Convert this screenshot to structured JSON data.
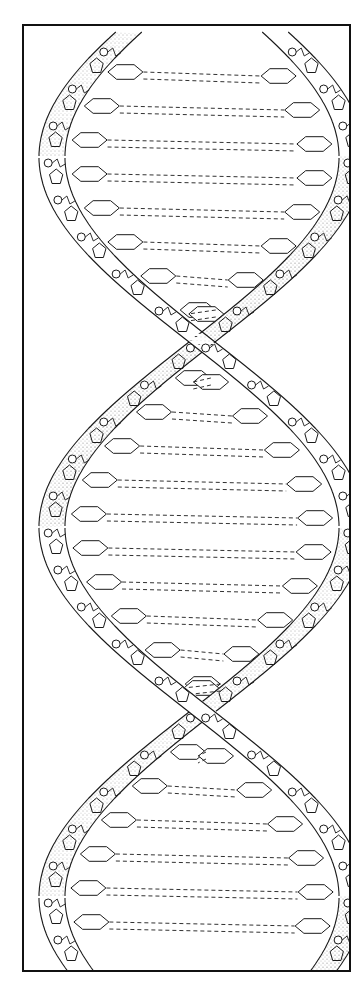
{
  "figure": {
    "frame": {
      "x": 22,
      "y": 24,
      "width": 329,
      "height": 948,
      "stroke": "#111111"
    },
    "colors": {
      "ink": "#1a1a1a",
      "paper": "#ffffff",
      "stipple": "#555555"
    },
    "helix": {
      "center_x": 200,
      "amplitude": 150,
      "period": 740,
      "phase_y": -30,
      "strand_width": 26,
      "top_y": 30,
      "bottom_y": 970
    },
    "components": [
      {
        "name": "sugar-phosphate-backbone",
        "count": 2
      },
      {
        "name": "phosphate-group",
        "shape": "circle"
      },
      {
        "name": "deoxyribose-sugar",
        "shape": "pentagon"
      },
      {
        "name": "nitrogenous-base",
        "shape": "hexagon"
      },
      {
        "name": "hydrogen-bond",
        "shape": "dashed-line"
      }
    ]
  }
}
